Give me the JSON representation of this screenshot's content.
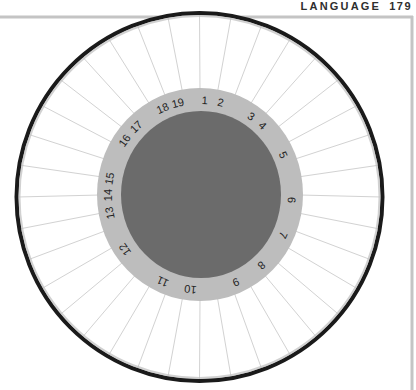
{
  "header": {
    "section": "LANGUAGE",
    "page_number": "179"
  },
  "diagram": {
    "frame_color": "#c4c4c4",
    "outer_circle_color": "#1a1a1a",
    "spoke_color": "#d2d2d2",
    "ring_color": "#bdbdbd",
    "disc_color": "#6b6b6b",
    "spoke_count": 36,
    "labels": [
      {
        "text": "1",
        "angle": 3
      },
      {
        "text": "2",
        "angle": 13
      },
      {
        "text": "3",
        "angle": 34
      },
      {
        "text": "4",
        "angle": 43
      },
      {
        "text": "5",
        "angle": 65
      },
      {
        "text": "6",
        "angle": 93
      },
      {
        "text": "7",
        "angle": 115
      },
      {
        "text": "8",
        "angle": 138
      },
      {
        "text": "9",
        "angle": 157
      },
      {
        "text": "10",
        "angle": 186
      },
      {
        "text": "11",
        "angle": 204
      },
      {
        "text": "12",
        "angle": 235
      },
      {
        "text": "13",
        "angle": 259
      },
      {
        "text": "14",
        "angle": 270
      },
      {
        "text": "15",
        "angle": 280
      },
      {
        "text": "16",
        "angle": 305
      },
      {
        "text": "17",
        "angle": 316
      },
      {
        "text": "18",
        "angle": 336
      },
      {
        "text": "19",
        "angle": 346
      }
    ]
  }
}
